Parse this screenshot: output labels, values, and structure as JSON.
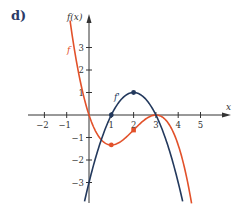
{
  "figure_label": "d)",
  "colors": {
    "f": "#e2512a",
    "f_prime": "#23395d",
    "axis": "#333333",
    "label": "#2b3a67"
  },
  "chart_data": {
    "type": "line",
    "title": "",
    "xlabel": "x",
    "ylabel": "f(x)",
    "xlim": [
      -2.7,
      6.3
    ],
    "ylim": [
      -3.8,
      4.1
    ],
    "x_ticks": [
      -2,
      -1,
      1,
      2,
      3,
      4,
      5
    ],
    "y_ticks": [
      -3,
      -2,
      -1,
      1,
      2,
      3
    ],
    "grid": false,
    "legend": "inline labels",
    "series": [
      {
        "name": "f",
        "formula": "-x^3/3 + 2x^2 - 3x",
        "x": [
          -0.85,
          -0.5,
          0,
          0.5,
          1,
          1.5,
          2,
          2.5,
          3,
          3.5,
          4,
          4.5,
          4.6
        ],
        "y": [
          3.99,
          2.04,
          0,
          -0.96,
          -1.33,
          -1.13,
          -0.67,
          -0.21,
          0,
          -0.29,
          -1.33,
          -3.38,
          -3.79
        ],
        "marked_points": [
          {
            "x": 1,
            "y": -1.33
          },
          {
            "x": 2,
            "y": -0.67
          }
        ]
      },
      {
        "name": "f'",
        "formula": "-(x-1)(x-3)",
        "x": [
          -0.2,
          0,
          0.5,
          1,
          1.5,
          2,
          2.5,
          3,
          3.5,
          4,
          4.2
        ],
        "y": [
          -3.84,
          -3,
          -1.25,
          0,
          0.75,
          1,
          0.75,
          0,
          -1.25,
          -3,
          -3.84
        ],
        "marked_points": [
          {
            "x": 1,
            "y": 0
          },
          {
            "x": 2,
            "y": 1
          }
        ]
      }
    ],
    "annotations": [
      {
        "text": "f",
        "near_series": "f"
      },
      {
        "text": "f'",
        "near_series": "f'"
      }
    ]
  },
  "axis_labels": {
    "x": "x",
    "y": "f(x)"
  },
  "series_labels": {
    "f": "f",
    "f_prime": "f'"
  }
}
